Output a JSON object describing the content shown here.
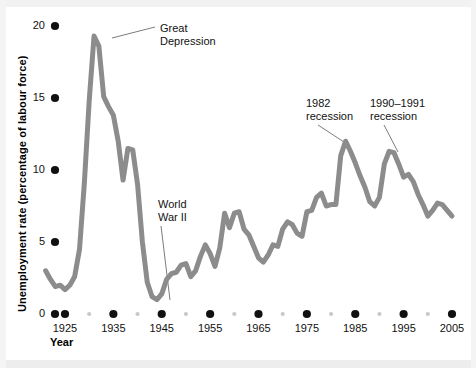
{
  "chart_data": {
    "type": "line",
    "title": "",
    "xlabel": "Year",
    "ylabel": "Unemployment rate (percentage of labour force)",
    "xlim": [
      1920,
      2006
    ],
    "ylim": [
      0,
      21
    ],
    "grid": false,
    "legend": "none",
    "line_color": "#8c8c8c",
    "marker_color_major": "#111111",
    "marker_color_minor": "#c8c8c8",
    "xticks_major": [
      1925,
      1935,
      1945,
      1955,
      1965,
      1975,
      1985,
      1995,
      2005
    ],
    "xticks_minor": [
      1930,
      1940,
      1950,
      1960,
      1970,
      1980,
      1990,
      2000
    ],
    "xtick_labels": [
      "1925",
      "1935",
      "1945",
      "1955",
      "1965",
      "1975",
      "1985",
      "1995",
      "2005"
    ],
    "yticks": [
      0,
      5,
      10,
      15,
      20
    ],
    "ytick_labels": [
      "0",
      "5",
      "10",
      "15",
      "20"
    ],
    "series": [
      {
        "name": "Unemployment rate",
        "x": [
          1921,
          1922,
          1923,
          1924,
          1925,
          1926,
          1927,
          1928,
          1929,
          1930,
          1931,
          1932,
          1933,
          1934,
          1935,
          1936,
          1937,
          1938,
          1939,
          1940,
          1941,
          1942,
          1943,
          1944,
          1945,
          1946,
          1947,
          1948,
          1949,
          1950,
          1951,
          1952,
          1953,
          1954,
          1955,
          1956,
          1957,
          1958,
          1959,
          1960,
          1961,
          1962,
          1963,
          1964,
          1965,
          1966,
          1967,
          1968,
          1969,
          1970,
          1971,
          1972,
          1973,
          1974,
          1975,
          1976,
          1977,
          1978,
          1979,
          1980,
          1981,
          1982,
          1983,
          1984,
          1985,
          1986,
          1987,
          1988,
          1989,
          1990,
          1991,
          1992,
          1993,
          1994,
          1995,
          1996,
          1997,
          1998,
          1999,
          2000,
          2001,
          2002,
          2003,
          2004,
          2005
        ],
        "y": [
          3.0,
          2.4,
          1.9,
          2.0,
          1.7,
          2.0,
          2.6,
          4.5,
          9.1,
          14.8,
          19.3,
          18.6,
          15.1,
          14.4,
          13.8,
          12.0,
          9.3,
          11.5,
          11.4,
          9.0,
          5.0,
          2.2,
          1.2,
          1.0,
          1.4,
          2.4,
          2.8,
          2.9,
          3.4,
          3.5,
          2.6,
          3.0,
          4.0,
          4.8,
          4.2,
          3.3,
          4.6,
          7.0,
          6.0,
          7.0,
          7.1,
          5.9,
          5.5,
          4.7,
          3.9,
          3.6,
          4.1,
          4.8,
          4.7,
          5.9,
          6.4,
          6.2,
          5.6,
          5.4,
          7.1,
          7.2,
          8.1,
          8.4,
          7.5,
          7.6,
          7.6,
          11.0,
          12.0,
          11.3,
          10.5,
          9.6,
          8.8,
          7.8,
          7.5,
          8.1,
          10.4,
          11.3,
          11.2,
          10.4,
          9.5,
          9.7,
          9.2,
          8.3,
          7.6,
          6.8,
          7.2,
          7.7,
          7.6,
          7.2,
          6.8
        ]
      }
    ],
    "annotations": [
      {
        "id": "great-depression",
        "line1": "Great",
        "line2": "Depression",
        "text": "Great Depression",
        "text_x": 160,
        "text_y": 22,
        "leader_from_x": 112,
        "leader_from_y": 38,
        "leader_to_x": 155,
        "leader_to_y": 27,
        "target_year": 1931,
        "target_value": 19.3
      },
      {
        "id": "world-war-ii",
        "line1": "World",
        "line2": "War II",
        "text": "World War II",
        "text_x": 158,
        "text_y": 198,
        "leader_from_x": 170,
        "leader_from_y": 300,
        "leader_to_x": 161,
        "leader_to_y": 226,
        "target_year": 1944,
        "target_value": 1.0
      },
      {
        "id": "recession-1982",
        "line1": "1982",
        "line2": "recession",
        "text": "1982 recession",
        "text_x": 306,
        "text_y": 97,
        "leader_from_x": 344,
        "leader_from_y": 142,
        "leader_to_x": 318,
        "leader_to_y": 125,
        "target_year": 1982,
        "target_value": 12.0
      },
      {
        "id": "recession-1990-1991",
        "line1": "1990–1991",
        "line2": "recession",
        "text": "1990–1991 recession",
        "text_x": 370,
        "text_y": 97,
        "leader_from_x": 398,
        "leader_from_y": 152,
        "leader_to_x": 384,
        "leader_to_y": 125,
        "target_year": 1992,
        "target_value": 11.3
      }
    ]
  }
}
